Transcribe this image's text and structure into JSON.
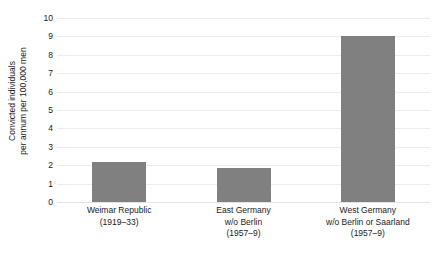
{
  "chart_data": {
    "type": "bar",
    "title": "",
    "subtitle": "",
    "xlabel": "",
    "ylabel": "Convicted individuals per annum per 100,000 men",
    "ylabel_lines": [
      "Convicted individuals",
      "per annum per 100,000 men"
    ],
    "categories": [
      "Weimar Republic (1919–33)",
      "East Germany w/o Berlin (1957–9)",
      "West Germany w/o Berlin or Saarland (1957–9)"
    ],
    "category_lines": [
      [
        "Weimar Republic",
        "(1919–33)"
      ],
      [
        "East Germany",
        "w/o Berlin",
        "(1957–9)"
      ],
      [
        "West Germany",
        "w/o Berlin or Saarland",
        "(1957–9)"
      ]
    ],
    "values": [
      2.2,
      1.85,
      9.0
    ],
    "ylim": [
      0,
      10
    ],
    "ytick_labels": [
      "10",
      "9",
      "8",
      "7",
      "6",
      "5",
      "4",
      "3",
      "2",
      "1",
      "0"
    ],
    "ytick_values": [
      10,
      9,
      8,
      7,
      6,
      5,
      4,
      3,
      2,
      1,
      0
    ],
    "grid": true,
    "legend": "none",
    "bar_color": "#808080",
    "grid_color": "#ececec",
    "text_color": "#1a1a1a",
    "background": "#ffffff"
  }
}
